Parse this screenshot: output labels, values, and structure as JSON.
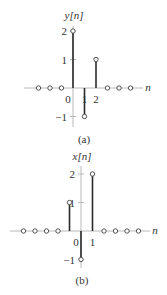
{
  "figures": [
    {
      "id": "a",
      "title": "y[n]",
      "caption": "(a)",
      "axis_label_x": "n",
      "y_ticks": [
        2,
        1,
        -1
      ],
      "x_tick_labels": [
        {
          "n": 0,
          "label": "0"
        },
        {
          "n": 1,
          "label": "1"
        },
        {
          "n": 2,
          "label": "2"
        }
      ],
      "origin": {
        "x": 73,
        "y": 88
      },
      "dx": 11.5,
      "dy": 28.5,
      "x_axis_range": [
        24,
        143
      ],
      "y_axis_range": [
        26,
        127
      ],
      "samples": [
        {
          "n": -3,
          "value": 0
        },
        {
          "n": -2,
          "value": 0
        },
        {
          "n": -1,
          "value": 0
        },
        {
          "n": 0,
          "value": 2
        },
        {
          "n": 1,
          "value": -1
        },
        {
          "n": 2,
          "value": 1
        },
        {
          "n": 3,
          "value": 0
        },
        {
          "n": 4,
          "value": 0
        },
        {
          "n": 5,
          "value": 0
        }
      ]
    },
    {
      "id": "b",
      "title": "x[n]",
      "caption": "(b)",
      "axis_label_x": "n",
      "y_ticks": [
        2,
        1,
        -1
      ],
      "x_tick_labels": [
        {
          "n": 0,
          "label": "0"
        },
        {
          "n": 1,
          "label": "1"
        }
      ],
      "origin": {
        "x": 81,
        "y": 231
      },
      "dx": 11.5,
      "dy": 28.5,
      "x_axis_range": [
        10,
        150
      ],
      "y_axis_range": [
        166,
        268
      ],
      "samples": [
        {
          "n": -5,
          "value": 0
        },
        {
          "n": -4,
          "value": 0
        },
        {
          "n": -3,
          "value": 0
        },
        {
          "n": -2,
          "value": 0
        },
        {
          "n": -1,
          "value": 1
        },
        {
          "n": 0,
          "value": -1
        },
        {
          "n": 1,
          "value": 2
        },
        {
          "n": 2,
          "value": 0
        },
        {
          "n": 3,
          "value": 0
        },
        {
          "n": 4,
          "value": 0
        },
        {
          "n": 5,
          "value": 0
        }
      ]
    }
  ],
  "colors": {
    "axis": "#b8b8b8",
    "stem": "#2a2a2a",
    "marker_stroke": "#444444",
    "text": "#333333"
  }
}
